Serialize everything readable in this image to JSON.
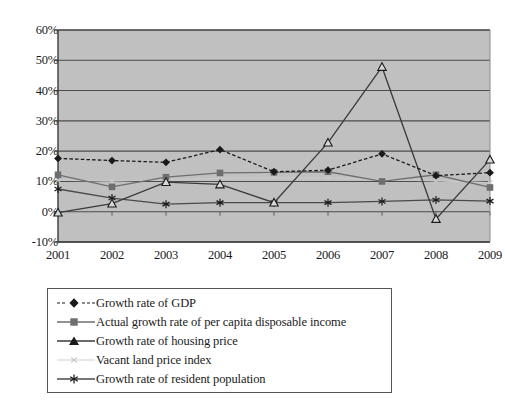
{
  "chart_data": {
    "type": "line",
    "title": "",
    "subtitle": "",
    "xlabel": "",
    "ylabel": "",
    "categories": [
      "2001",
      "2002",
      "2003",
      "2004",
      "2005",
      "2006",
      "2007",
      "2008",
      "2009"
    ],
    "x_tick_labels": [
      "2001",
      "2002",
      "2003",
      "2004",
      "2005",
      "2006",
      "2007",
      "2008",
      "2009"
    ],
    "y_tick_labels": [
      "60%",
      "50%",
      "40%",
      "30%",
      "20%",
      "10%",
      "0%",
      "-10%"
    ],
    "y_tick_values": [
      60,
      50,
      40,
      30,
      20,
      10,
      0,
      -10
    ],
    "ylim": [
      -10,
      60
    ],
    "y_unit": "%",
    "grid": "horizontal",
    "legend_position": "below-plot-left",
    "plot_background": "#c0c0c0",
    "series": [
      {
        "name": "Growth rate of GDP",
        "marker": "diamond",
        "color": "#1a1a1a",
        "line_style": "dashed",
        "values": [
          17.6,
          16.9,
          16.3,
          20.5,
          13.2,
          13.7,
          19.1,
          11.9,
          12.9
        ]
      },
      {
        "name": "Actual growth rate of per capita disposable income",
        "marker": "square",
        "color": "#6e6e6e",
        "line_style": "solid",
        "values": [
          12.2,
          8.2,
          11.4,
          12.8,
          13.0,
          13.2,
          10.0,
          12.2,
          8.0
        ]
      },
      {
        "name": "Growth rate of housing price",
        "marker": "triangle",
        "color": "#3a3a3a",
        "line_style": "solid",
        "values": [
          -0.3,
          2.7,
          9.8,
          9.0,
          3.0,
          22.8,
          47.8,
          -2.4,
          17.2
        ]
      },
      {
        "name": "Vacant land price index",
        "marker": "small-x",
        "color": "#c8c8c8",
        "line_style": "solid",
        "values": [
          10.4,
          10.1,
          10.6,
          11.0,
          11.2,
          11.2,
          10.6,
          10.2,
          9.6
        ]
      },
      {
        "name": "Growth rate of resident population",
        "marker": "asterisk",
        "color": "#4a4a4a",
        "line_style": "solid",
        "values": [
          7.5,
          4.5,
          2.5,
          3.0,
          3.0,
          3.0,
          3.4,
          3.9,
          3.5
        ]
      }
    ]
  },
  "legend": {
    "items": [
      {
        "label": "Growth rate of GDP",
        "marker": "diamond-icon"
      },
      {
        "label": "Actual growth rate of per capita disposable income",
        "marker": "square-icon"
      },
      {
        "label": "Growth rate of housing price",
        "marker": "triangle-icon"
      },
      {
        "label": "Vacant land price index",
        "marker": "small-x-icon"
      },
      {
        "label": "Growth rate of resident population",
        "marker": "asterisk-icon"
      }
    ]
  },
  "colors": {
    "plot_background": "#c0c0c0",
    "gridline": "#4d4d4d",
    "axis": "#3a3a3a",
    "page_background": "#ffffff"
  }
}
